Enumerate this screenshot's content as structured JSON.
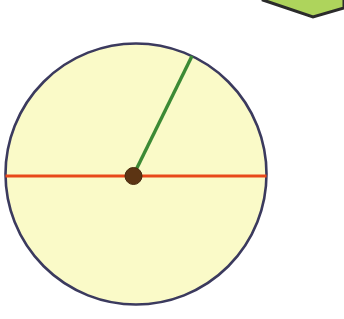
{
  "canvas": {
    "width": 344,
    "height": 319,
    "background": "#ffffff",
    "title": "Circle with radius and diameter"
  },
  "shapes": {
    "circle": {
      "label": "circle",
      "cx": 136,
      "cy": 174,
      "r": 130.5,
      "fill": "#fafac8",
      "stroke": "#3b3a5e",
      "stroke_width": 2.6
    },
    "diameter_line": {
      "label": "diameter",
      "x1": 5.5,
      "y1": 176,
      "x2": 266.5,
      "y2": 176,
      "stroke": "#e8481a",
      "stroke_width": 3.2
    },
    "radius_line": {
      "label": "radius",
      "x1": 133,
      "y1": 176,
      "x2": 192,
      "y2": 56,
      "stroke": "#3c8a35",
      "stroke_width": 3.4
    },
    "center_dot": {
      "label": "center point",
      "cx": 133.5,
      "cy": 176,
      "r": 8.5,
      "fill": "#5c3413",
      "stroke": "#46280d",
      "stroke_width": 1
    },
    "corner_polygon": {
      "label": "green polygon corner",
      "points": "257,-40 263,0 313,17 344,8 344,-40",
      "fill": "#aed45c",
      "stroke": "#2b2b2b",
      "stroke_width": 3
    }
  }
}
